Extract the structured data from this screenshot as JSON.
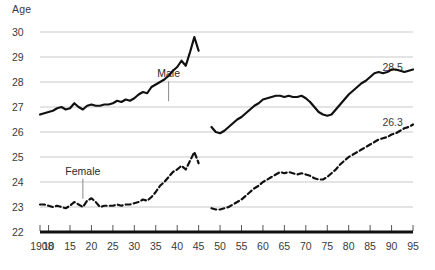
{
  "chart_data": {
    "type": "line",
    "title": "",
    "xlabel": "",
    "ylabel": "Age",
    "ylim": [
      22,
      30
    ],
    "xlim": [
      1908,
      1995
    ],
    "grid": true,
    "legend": "inline-annotations",
    "ytick_labels": [
      "30",
      "29",
      "28",
      "27",
      "26",
      "25",
      "24",
      "23",
      "22"
    ],
    "ytick_values": [
      30,
      29,
      28,
      27,
      26,
      25,
      24,
      23,
      22
    ],
    "xtick_labels": [
      "1908",
      "10",
      "15",
      "20",
      "25",
      "30",
      "35",
      "40",
      "45",
      "50",
      "55",
      "60",
      "65",
      "70",
      "75",
      "80",
      "85",
      "90",
      "95"
    ],
    "xtick_values": [
      1908,
      1910,
      1915,
      1920,
      1925,
      1930,
      1935,
      1940,
      1945,
      1950,
      1955,
      1960,
      1965,
      1970,
      1975,
      1980,
      1985,
      1990,
      1995
    ],
    "annotations": [
      {
        "text": "Male",
        "x": 1938,
        "y": 28.35
      },
      {
        "text": "Female",
        "x": 1918,
        "y": 24.45
      }
    ],
    "end_labels": [
      {
        "text": "28.5",
        "x": 1993,
        "y": 28.62,
        "series": "Male"
      },
      {
        "text": "26.3",
        "x": 1993,
        "y": 26.42,
        "series": "Female"
      }
    ],
    "series": [
      {
        "name": "Male",
        "style": "solid",
        "color": "#111111",
        "x": [
          1908,
          1909,
          1910,
          1911,
          1912,
          1913,
          1914,
          1915,
          1916,
          1917,
          1918,
          1919,
          1920,
          1921,
          1922,
          1923,
          1924,
          1925,
          1926,
          1927,
          1928,
          1929,
          1930,
          1931,
          1932,
          1933,
          1934,
          1935,
          1936,
          1937,
          1938,
          1939,
          1940,
          1941,
          1942,
          1943,
          1944,
          1945,
          1948,
          1949,
          1950,
          1951,
          1952,
          1953,
          1954,
          1955,
          1956,
          1957,
          1958,
          1959,
          1960,
          1961,
          1962,
          1963,
          1964,
          1965,
          1966,
          1967,
          1968,
          1969,
          1970,
          1971,
          1972,
          1973,
          1974,
          1975,
          1976,
          1977,
          1978,
          1979,
          1980,
          1981,
          1982,
          1983,
          1984,
          1985,
          1986,
          1987,
          1988,
          1989,
          1990,
          1991,
          1992,
          1993,
          1994,
          1995
        ],
        "y": [
          26.7,
          26.75,
          26.8,
          26.85,
          26.95,
          27.0,
          26.9,
          26.95,
          27.15,
          27.0,
          26.9,
          27.05,
          27.1,
          27.05,
          27.05,
          27.1,
          27.1,
          27.15,
          27.25,
          27.2,
          27.3,
          27.25,
          27.35,
          27.5,
          27.6,
          27.55,
          27.8,
          27.9,
          28.0,
          28.1,
          28.25,
          28.45,
          28.6,
          28.85,
          28.65,
          29.2,
          29.8,
          29.25,
          26.2,
          26.0,
          25.95,
          26.05,
          26.2,
          26.35,
          26.5,
          26.6,
          26.75,
          26.9,
          27.05,
          27.15,
          27.3,
          27.35,
          27.4,
          27.45,
          27.45,
          27.4,
          27.45,
          27.4,
          27.4,
          27.45,
          27.35,
          27.2,
          27.0,
          26.8,
          26.7,
          26.65,
          26.7,
          26.9,
          27.1,
          27.3,
          27.5,
          27.65,
          27.8,
          27.95,
          28.05,
          28.2,
          28.35,
          28.4,
          28.35,
          28.4,
          28.5,
          28.5,
          28.45,
          28.4,
          28.45,
          28.5
        ]
      },
      {
        "name": "Female",
        "style": "dashed",
        "color": "#111111",
        "x": [
          1908,
          1909,
          1910,
          1911,
          1912,
          1913,
          1914,
          1915,
          1916,
          1917,
          1918,
          1919,
          1920,
          1921,
          1922,
          1923,
          1924,
          1925,
          1926,
          1927,
          1928,
          1929,
          1930,
          1931,
          1932,
          1933,
          1934,
          1935,
          1936,
          1937,
          1938,
          1939,
          1940,
          1941,
          1942,
          1943,
          1944,
          1945,
          1948,
          1949,
          1950,
          1951,
          1952,
          1953,
          1954,
          1955,
          1956,
          1957,
          1958,
          1959,
          1960,
          1961,
          1962,
          1963,
          1964,
          1965,
          1966,
          1967,
          1968,
          1969,
          1970,
          1971,
          1972,
          1973,
          1974,
          1975,
          1976,
          1977,
          1978,
          1979,
          1980,
          1981,
          1982,
          1983,
          1984,
          1985,
          1986,
          1987,
          1988,
          1989,
          1990,
          1991,
          1992,
          1993,
          1994,
          1995
        ],
        "y": [
          23.1,
          23.1,
          23.05,
          23.0,
          23.05,
          23.0,
          22.95,
          23.05,
          23.2,
          23.1,
          23.0,
          23.25,
          23.35,
          23.2,
          23.0,
          23.05,
          23.05,
          23.05,
          23.1,
          23.05,
          23.1,
          23.1,
          23.15,
          23.2,
          23.3,
          23.25,
          23.4,
          23.6,
          23.85,
          24.0,
          24.2,
          24.4,
          24.5,
          24.65,
          24.5,
          24.85,
          25.2,
          24.75,
          22.95,
          22.9,
          22.9,
          22.95,
          23.0,
          23.1,
          23.2,
          23.3,
          23.45,
          23.6,
          23.75,
          23.85,
          24.0,
          24.1,
          24.2,
          24.3,
          24.4,
          24.35,
          24.4,
          24.35,
          24.3,
          24.35,
          24.3,
          24.25,
          24.15,
          24.1,
          24.1,
          24.2,
          24.35,
          24.5,
          24.7,
          24.85,
          25.0,
          25.1,
          25.2,
          25.3,
          25.4,
          25.5,
          25.6,
          25.7,
          25.75,
          25.8,
          25.9,
          25.95,
          26.05,
          26.15,
          26.2,
          26.3
        ]
      }
    ]
  }
}
